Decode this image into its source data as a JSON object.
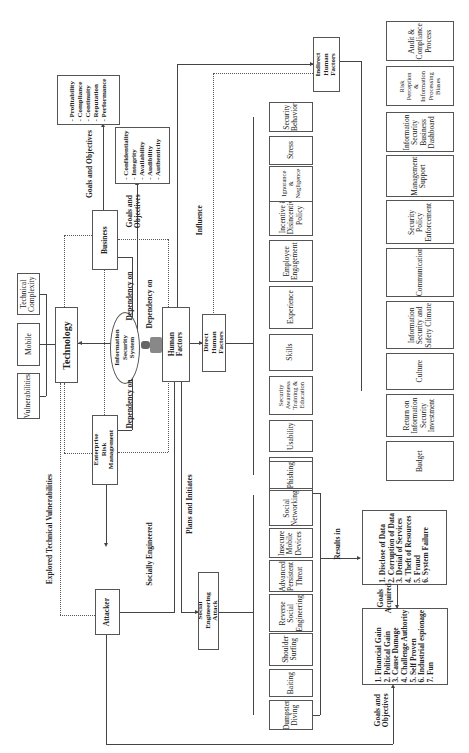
{
  "diagram": {
    "orientation": "rotated-90-ccw",
    "center": {
      "label": "Information\nSecurity System",
      "icon": "person-icon"
    },
    "nodes": {
      "business": "Business",
      "technology": "Technology",
      "erm": "Enterprise Risk\nManagement",
      "human_factors": "Human Factors",
      "direct_hf": "Direct Human\nFactors",
      "indirect_hf": "Indirect Human\nFactors",
      "attacker": "Attacker",
      "sea": "Social Engineering\nAttack"
    },
    "business_goals": "- Profitability\n- Compliance\n- Continuity\n- Reputation\n- Performance",
    "security_goals": "- Confidentiality\n- Integrity\n- Availability\n- Audibility\n- Authenticity",
    "tech_factors": [
      "Vulnerabilities",
      "Mobile",
      "Technical\nComplexity"
    ],
    "direct_factors": [
      "Error",
      "Usability",
      "Security\nAwareness\nTraining &\nEducation",
      "Skills",
      "Experience",
      "Employee\nEngagement",
      "Incentive &\nDisincentive\nPolicy",
      "Ignorance\n&\nNegligence",
      "Stress",
      "Security\nBehavior"
    ],
    "indirect_factors": [
      "Budget",
      "Return on\nInformation\nSecurity\nInvestment",
      "Culture",
      "Information\nSecurity and\nSafety Climate",
      "Communication",
      "Security\nPolicy\nEnforcement",
      "Management\nSupport",
      "Information\nSecurity\nBusiness\nDashboard",
      "Risk\nPerception\n&\nInformation\nProcessing\nBiases",
      "Audit &\nCompliance\nProcess"
    ],
    "attacks": [
      "Dumpster\nDiving",
      "Baiting",
      "Shoulder\nSurfing",
      "Reverse\nSocial\nEngineering",
      "Advanced\nPersistent\nThreat",
      "Insecure\nMobile\nDevices",
      "Social\nNetworking",
      "Phishing"
    ],
    "results": "1. Disclose of Data\n2. Corruption of Data\n3. Denial of Services\n4. Theft of Resources\n5. Fraud\n6. System Failure",
    "attacker_goals": "1. Financial Gain\n2. Political Gain\n3. Cause Damage\n4. Challenge Authority\n5. Self Proven\n6. Industrial espionage\n7. Fun",
    "edge_labels": {
      "goals_objectives_1": "Goals and Objectives",
      "goals_objectives_2": "Goals and\nObjectives",
      "dependency_1": "Dependency on",
      "dependency_2": "Dependency on",
      "dependency_3": "Dependency on",
      "influence": "Influence",
      "explored": "Explored Technical Vulnerabilities",
      "socially": "Socially Engineered",
      "plans": "Plans and Initiates",
      "results_in": "Results in",
      "goals_acquired": "Goals\nAcquired",
      "goals_objectives_3": "Goals and\nObjectives"
    }
  }
}
